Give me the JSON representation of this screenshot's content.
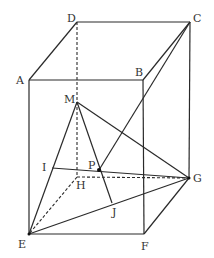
{
  "diagram": {
    "type": "geometry-rectangular-prism",
    "line_color": "#2a2a2a",
    "vertices": {
      "A": [
        29,
        80
      ],
      "B": [
        143,
        80
      ],
      "C": [
        190,
        22
      ],
      "D": [
        77,
        22
      ],
      "E": [
        29,
        234
      ],
      "F": [
        144,
        234
      ],
      "G": [
        189,
        178
      ],
      "H": [
        77,
        177
      ],
      "M": [
        77,
        102
      ],
      "I": [
        52,
        168
      ],
      "P": [
        99,
        170
      ],
      "J": [
        112,
        203
      ]
    },
    "labels": {
      "A": "A",
      "B": "B",
      "C": "C",
      "D": "D",
      "E": "E",
      "F": "F",
      "G": "G",
      "H": "H",
      "M": "M",
      "I": "I",
      "P": "P",
      "J": "J"
    }
  }
}
